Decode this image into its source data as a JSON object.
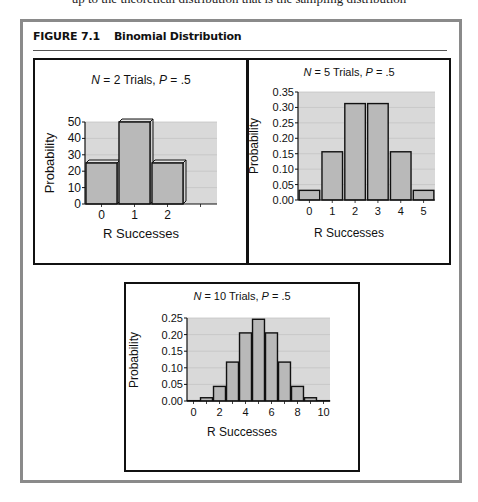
{
  "page": {
    "cut_text": "up to the theoretical distribution that is the sampling distribution"
  },
  "figure": {
    "number": "FIGURE 7.1",
    "title": "Binomial Distribution"
  },
  "colors": {
    "frame": "#8a8a8a",
    "plot_bg": "#d9d9d9",
    "bar_fill": "#b9b9b9",
    "bar_edge": "#111111",
    "gridline": "#c4c4c4"
  },
  "chart_data": [
    {
      "type": "bar",
      "title_italic_n": "N",
      "title_mid": " = 2 Trials, ",
      "title_italic_p": "P",
      "title_end": " = .5",
      "title": "N = 2 Trials, P = .5",
      "xlabel": "R Successes",
      "ylabel": "Probability",
      "categories": [
        "0",
        "1",
        "2"
      ],
      "values": [
        25,
        50,
        25
      ],
      "ylim": [
        0,
        50
      ],
      "yticks": [
        "0",
        "10",
        "20",
        "30",
        "40",
        "50"
      ],
      "grid": true,
      "legend": "none"
    },
    {
      "type": "bar",
      "title_italic_n": "N",
      "title_mid": " = 5 Trials, ",
      "title_italic_p": "P",
      "title_end": " = .5",
      "title": "N = 5 Trials, P = .5",
      "xlabel": "R Successes",
      "ylabel": "Probability",
      "categories": [
        "0",
        "1",
        "2",
        "3",
        "4",
        "5"
      ],
      "values": [
        0.03125,
        0.15625,
        0.3125,
        0.3125,
        0.15625,
        0.03125
      ],
      "ylim": [
        0,
        0.35
      ],
      "yticks": [
        "0.00",
        "0.05",
        "0.10",
        "0.15",
        "0.20",
        "0.25",
        "0.30",
        "0.35"
      ],
      "grid": true,
      "legend": "none"
    },
    {
      "type": "bar",
      "title_italic_n": "N",
      "title_mid": " = 10 Trials, ",
      "title_italic_p": "P",
      "title_end": " = .5",
      "title": "N = 10 Trials, P = .5",
      "xlabel": "R Successes",
      "ylabel": "Probability",
      "categories": [
        "0",
        "1",
        "2",
        "3",
        "4",
        "5",
        "6",
        "7",
        "8",
        "9",
        "10"
      ],
      "xtick_labels": [
        "0",
        "",
        "2",
        "",
        "4",
        "",
        "6",
        "",
        "8",
        "",
        "10"
      ],
      "values": [
        0.001,
        0.0098,
        0.0439,
        0.1172,
        0.2051,
        0.2461,
        0.2051,
        0.1172,
        0.0439,
        0.0098,
        0.001
      ],
      "ylim": [
        0,
        0.25
      ],
      "yticks": [
        "0.00",
        "0.05",
        "0.10",
        "0.15",
        "0.20",
        "0.25"
      ],
      "grid": true,
      "legend": "none"
    }
  ]
}
